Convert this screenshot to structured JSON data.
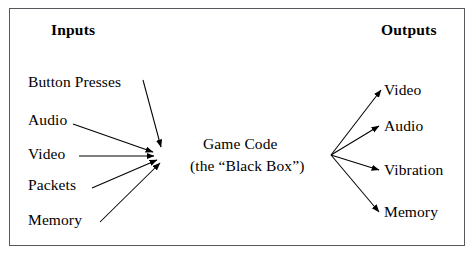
{
  "diagram": {
    "title_left": "Inputs",
    "title_right": "Outputs",
    "center": {
      "line1": "Game Code",
      "line2": "(the “Black Box”)"
    },
    "inputs": [
      {
        "label": "Button Presses"
      },
      {
        "label": "Audio"
      },
      {
        "label": "Video"
      },
      {
        "label": "Packets"
      },
      {
        "label": "Memory"
      }
    ],
    "outputs": [
      {
        "label": "Video"
      },
      {
        "label": "Audio"
      },
      {
        "label": "Vibration"
      },
      {
        "label": "Memory"
      }
    ],
    "colors": {
      "stroke": "#000000",
      "border": "#55585c",
      "background": "#ffffff",
      "text": "#000000"
    }
  }
}
